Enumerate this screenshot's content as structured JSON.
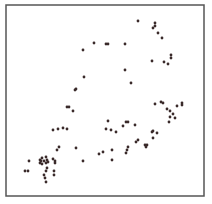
{
  "chart_data": {
    "type": "scatter",
    "title": "",
    "xlabel": "",
    "ylabel": "",
    "grid": false,
    "legend": null,
    "axes_ticks": false,
    "frame": {
      "left": 6,
      "top": 5,
      "right": 204,
      "bottom": 196
    },
    "marker_color": "#3a2a2a",
    "frame_color": "#555555",
    "note": "points are in pixel coordinates of the 212x204 image (no axis ticks shown)",
    "points": [
      [
        138,
        21
      ],
      [
        155,
        23
      ],
      [
        155,
        26
      ],
      [
        153,
        28
      ],
      [
        158,
        33
      ],
      [
        162,
        38
      ],
      [
        94,
        43
      ],
      [
        106,
        44
      ],
      [
        108,
        44
      ],
      [
        125,
        44
      ],
      [
        83,
        50
      ],
      [
        171,
        55
      ],
      [
        171,
        58
      ],
      [
        152,
        61
      ],
      [
        164,
        62
      ],
      [
        168,
        64
      ],
      [
        125,
        70
      ],
      [
        84,
        77
      ],
      [
        131,
        83
      ],
      [
        76,
        89
      ],
      [
        75,
        90
      ],
      [
        155,
        104
      ],
      [
        161,
        102
      ],
      [
        163,
        103
      ],
      [
        167,
        109
      ],
      [
        170,
        111
      ],
      [
        177,
        106
      ],
      [
        182,
        103
      ],
      [
        182,
        105
      ],
      [
        67,
        107
      ],
      [
        69,
        107
      ],
      [
        73,
        111
      ],
      [
        173,
        114
      ],
      [
        170,
        117
      ],
      [
        175,
        118
      ],
      [
        169,
        122
      ],
      [
        108,
        121
      ],
      [
        106,
        129
      ],
      [
        111,
        130
      ],
      [
        116,
        132
      ],
      [
        123,
        126
      ],
      [
        126,
        122
      ],
      [
        128,
        122
      ],
      [
        63,
        128
      ],
      [
        67,
        129
      ],
      [
        53,
        130
      ],
      [
        58,
        129
      ],
      [
        135,
        125
      ],
      [
        152,
        132
      ],
      [
        153,
        131
      ],
      [
        157,
        133
      ],
      [
        153,
        138
      ],
      [
        136,
        142
      ],
      [
        138,
        140
      ],
      [
        145,
        145
      ],
      [
        147,
        145
      ],
      [
        146,
        147
      ],
      [
        128,
        147
      ],
      [
        127,
        150
      ],
      [
        126,
        153
      ],
      [
        112,
        150
      ],
      [
        103,
        152
      ],
      [
        99,
        154
      ],
      [
        112,
        160
      ],
      [
        59,
        147
      ],
      [
        57,
        150
      ],
      [
        53,
        159
      ],
      [
        76,
        148
      ],
      [
        83,
        161
      ],
      [
        55,
        161
      ],
      [
        55,
        163
      ],
      [
        29,
        161
      ],
      [
        40,
        160
      ],
      [
        40,
        163
      ],
      [
        41,
        161
      ],
      [
        42,
        158
      ],
      [
        42,
        164
      ],
      [
        44,
        161
      ],
      [
        46,
        163
      ],
      [
        47,
        160
      ],
      [
        48,
        162
      ],
      [
        46,
        157
      ],
      [
        25,
        171
      ],
      [
        28,
        171
      ],
      [
        47,
        168
      ],
      [
        46,
        171
      ],
      [
        44,
        175
      ],
      [
        45,
        178
      ],
      [
        46,
        182
      ],
      [
        54,
        171
      ],
      [
        54,
        175
      ]
    ]
  }
}
